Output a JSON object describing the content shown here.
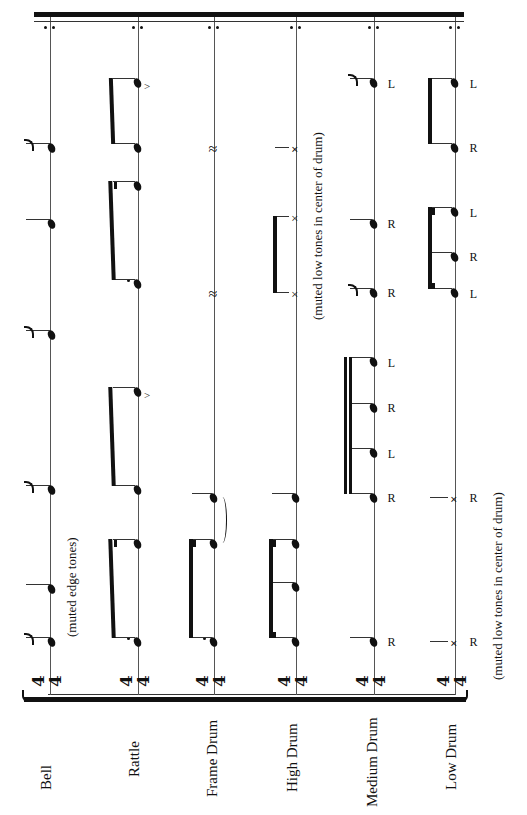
{
  "score": {
    "instruments": [
      {
        "name": "Bell"
      },
      {
        "name": "Rattle"
      },
      {
        "name": "Frame Drum"
      },
      {
        "name": "High Drum"
      },
      {
        "name": "Medium Drum"
      },
      {
        "name": "Low Drum"
      }
    ],
    "time_signature": {
      "numerator": "4",
      "denominator": "4"
    },
    "annotations": {
      "bell": "(muted edge tones)",
      "high_drum": "(muted low tones in center of drum)",
      "low_drum": "(muted low tones in center of drum)"
    },
    "sticking": {
      "medium_drum": [
        "R",
        "R",
        "L",
        "R",
        "L",
        "R",
        "R",
        "L"
      ],
      "low_drum": [
        "R",
        "R",
        "L",
        "R",
        "L",
        "R",
        "L"
      ]
    },
    "accent_symbol": ">",
    "rest_symbol": "𝄽",
    "x_symbol": "×",
    "repeat": "end-repeat"
  }
}
